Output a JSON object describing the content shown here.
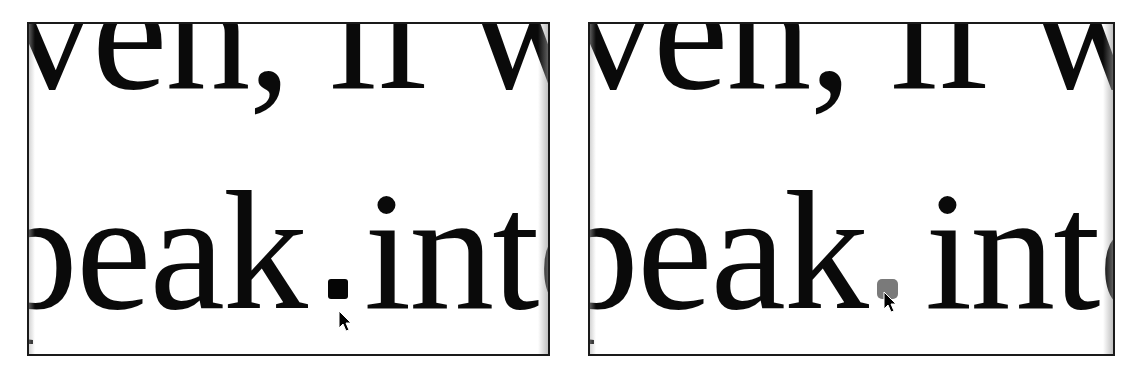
{
  "panels": [
    {
      "id": "left",
      "state": "cursor-inactive",
      "text_line_top": "ven, if w",
      "text_line_bottom_left": "peak",
      "text_line_bottom_right": "inte",
      "marker_color": "#050505"
    },
    {
      "id": "right",
      "state": "cursor-active",
      "text_line_top": "ven, if w",
      "text_line_bottom_left": "peak",
      "text_line_bottom_right": "inte",
      "marker_color": "#7a7a7a"
    }
  ]
}
